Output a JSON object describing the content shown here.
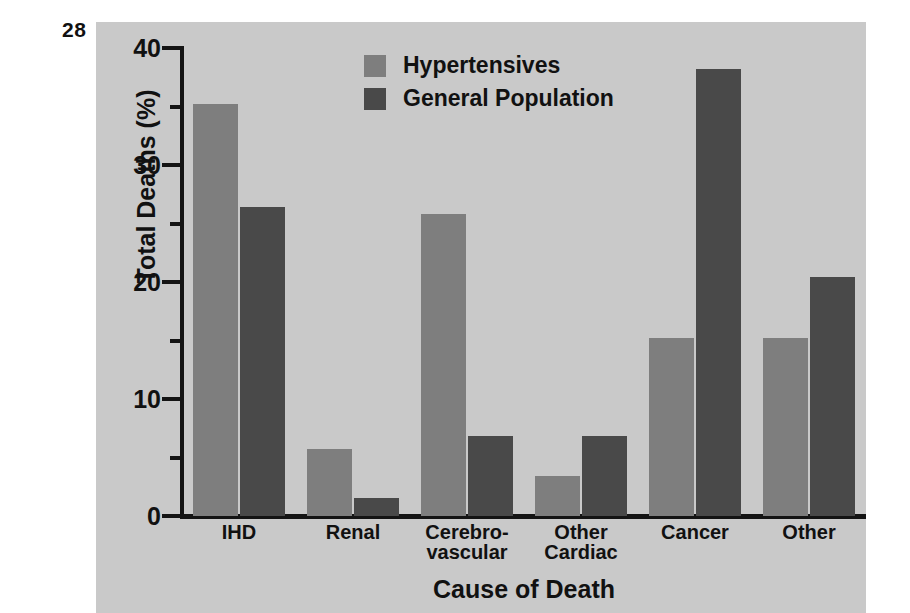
{
  "page_number": "28",
  "colors": {
    "panel_background": "#c9c9c9",
    "series_light": "#7e7e7e",
    "series_dark": "#494949",
    "axis": "#141414",
    "text": "#111111"
  },
  "legend": {
    "position": "top-center",
    "entries": [
      {
        "label": "Hypertensives",
        "color": "#7e7e7e"
      },
      {
        "label": "General Population",
        "color": "#494949"
      }
    ]
  },
  "chart_data": {
    "type": "bar",
    "title": "",
    "xlabel": "Cause of Death",
    "ylabel": "Total Deaths (%)",
    "ylim": [
      0,
      40
    ],
    "yticks": [
      0,
      10,
      20,
      30,
      40
    ],
    "ytick_labels": [
      "0",
      "10",
      "20",
      "30",
      "40"
    ],
    "yminorticks": [
      5,
      15,
      25,
      35
    ],
    "grid": false,
    "categories": [
      "IHD",
      "Renal",
      "Cerebro-\nvascular",
      "Other\nCardiac",
      "Cancer",
      "Other"
    ],
    "series": [
      {
        "name": "Hypertensives",
        "color": "#7e7e7e",
        "values": [
          35.2,
          5.7,
          25.8,
          3.4,
          15.2,
          15.2
        ]
      },
      {
        "name": "General Population",
        "color": "#494949",
        "values": [
          26.4,
          1.5,
          6.8,
          6.8,
          38.2,
          20.4
        ]
      }
    ]
  }
}
